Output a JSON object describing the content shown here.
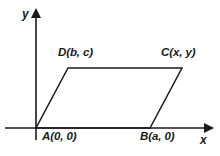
{
  "figure": {
    "type": "coordinate-geometry-diagram",
    "background_color": "#ffffff",
    "line_color": "#1a1a1a",
    "axes": {
      "x_axis_label": "x",
      "y_axis_label": "y",
      "x_axis_arrow": "right-arrow-icon",
      "y_axis_arrow": "up-arrow-icon",
      "origin_pixel": [
        36,
        128
      ]
    },
    "vertices": [
      {
        "key": "A",
        "label": "A(0, 0)",
        "point": [
          36,
          128
        ],
        "position": "below-axis-left"
      },
      {
        "key": "B",
        "label": "B(a, 0)",
        "point": [
          150,
          128
        ],
        "position": "below-axis-right"
      },
      {
        "key": "C",
        "label": "C(x, y)",
        "point": [
          182,
          68
        ],
        "position": "above-top-right"
      },
      {
        "key": "D",
        "label": "D(b, c)",
        "point": [
          68,
          68
        ],
        "position": "above-top-left"
      }
    ],
    "polygon_points": "36,128 150,128 182,68 68,68"
  }
}
